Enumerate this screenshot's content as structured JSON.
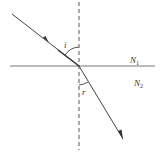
{
  "diagram": {
    "type": "refraction",
    "labels": {
      "incidence_angle": "i",
      "refraction_angle": "r",
      "medium1": "N",
      "medium1_sub": "1",
      "medium2": "N",
      "medium2_sub": "2"
    },
    "colors": {
      "line": "#555555",
      "text": "#333333"
    }
  }
}
